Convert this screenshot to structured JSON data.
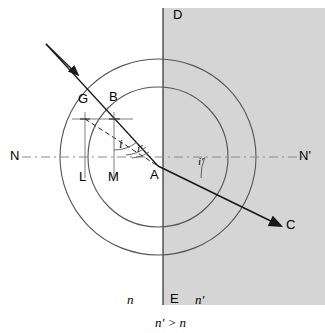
{
  "figure": {
    "colors": {
      "medium2_fill": "#d5d5d5",
      "line": "#1a1a1a",
      "circle": "#555555",
      "dashed_axis": "#808080",
      "construction": "#707070"
    }
  },
  "labels": {
    "normal_left": "N",
    "normal_right": "N'",
    "interface_top": "D",
    "interface_bottom": "E",
    "refracted_end": "C",
    "wavefront_left": "G",
    "wavefront_right": "B",
    "foot_left": "L",
    "foot_right": "M",
    "incidence_point": "A",
    "angle_incidence": "i",
    "angle_construction": "i'",
    "angle_refraction": "i'",
    "index_left": "n",
    "index_right": "n'",
    "relation": "n' > n"
  },
  "geometry": {
    "interface_x": 163,
    "center": {
      "x": 158,
      "y": 157
    },
    "outer_radius": 98,
    "inner_radius": 70,
    "point_A": {
      "x": 158,
      "y": 166
    },
    "point_B": {
      "x": 114,
      "y": 110
    },
    "point_G": {
      "x": 85,
      "y": 110
    },
    "point_L": {
      "x": 85,
      "y": 166
    },
    "point_M": {
      "x": 114,
      "y": 166
    },
    "point_C": {
      "x": 283,
      "y": 227
    },
    "incident_start": {
      "x": 46,
      "y": 44
    },
    "normal_y": 157
  }
}
